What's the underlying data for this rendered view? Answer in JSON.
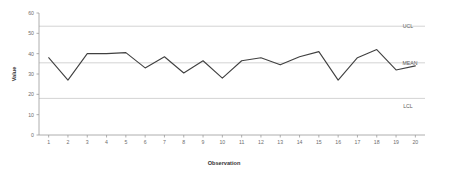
{
  "chart_data": {
    "type": "line",
    "title": "",
    "xlabel": "Observation",
    "ylabel": "Value",
    "x": [
      1,
      2,
      3,
      4,
      5,
      6,
      7,
      8,
      9,
      10,
      11,
      12,
      13,
      14,
      15,
      16,
      17,
      18,
      19,
      20
    ],
    "categories": [
      "1",
      "2",
      "3",
      "4",
      "5",
      "6",
      "7",
      "8",
      "9",
      "10",
      "11",
      "12",
      "13",
      "14",
      "15",
      "16",
      "17",
      "18",
      "19",
      "20"
    ],
    "values": [
      38,
      27,
      40,
      40,
      40.5,
      33,
      38.5,
      30.5,
      36.5,
      28,
      36.5,
      38,
      34.5,
      38.5,
      41,
      27,
      38,
      42,
      32,
      34
    ],
    "series": [
      {
        "name": "Value",
        "values": [
          38,
          27,
          40,
          40,
          40.5,
          33,
          38.5,
          30.5,
          36.5,
          28,
          36.5,
          38,
          34.5,
          38.5,
          41,
          27,
          38,
          42,
          32,
          34
        ]
      }
    ],
    "ylim": [
      0,
      60
    ],
    "xlim": [
      1,
      20
    ],
    "yticks": [
      0,
      10,
      20,
      30,
      40,
      50,
      60
    ],
    "ytick_labels": [
      "0",
      "10",
      "20",
      "30",
      "40",
      "50",
      "60"
    ],
    "grid": false,
    "legend_position": "right-inline",
    "reference_lines": [
      {
        "name": "UCL",
        "label": "UCL",
        "value": 53.5,
        "color": "#c8c8c8"
      },
      {
        "name": "MEAN",
        "label": "MEAN",
        "value": 35.5,
        "color": "#c8c8c8"
      },
      {
        "name": "LCL",
        "label": "LCL",
        "value": 18,
        "color": "#c8c8c8"
      }
    ],
    "line_color": "#404040",
    "axis_color": "#9a9a9a"
  }
}
